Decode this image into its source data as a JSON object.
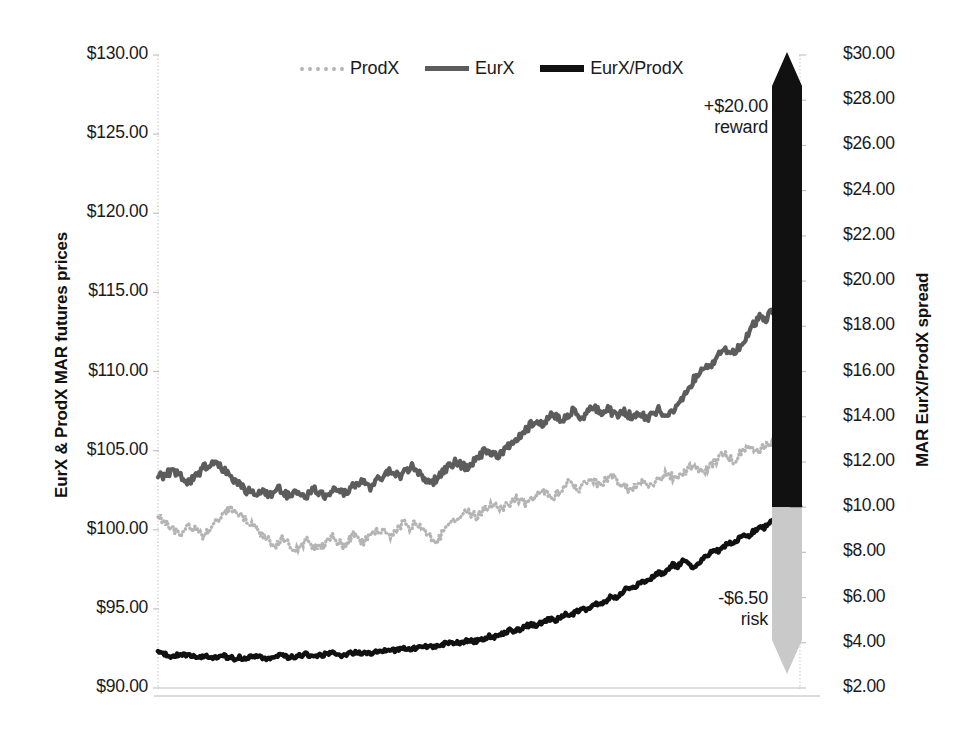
{
  "chart_data": {
    "type": "line",
    "title": "",
    "xlabel": "",
    "grid": false,
    "legend_position": "top-center",
    "axes": {
      "left": {
        "label": "EurX & ProdX MAR futures prices",
        "ticks": [
          "$90.00",
          "$95.00",
          "$100.00",
          "$105.00",
          "$110.00",
          "$115.00",
          "$120.00",
          "$125.00",
          "$130.00"
        ],
        "tick_values": [
          90,
          95,
          100,
          105,
          110,
          115,
          120,
          125,
          130
        ],
        "ylim": [
          90,
          130
        ]
      },
      "right": {
        "label": "MAR EurX/ProdX spread",
        "ticks": [
          "$2.00",
          "$4.00",
          "$6.00",
          "$8.00",
          "$10.00",
          "$12.00",
          "$14.00",
          "$16.00",
          "$18.00",
          "$20.00",
          "$22.00",
          "$24.00",
          "$26.00",
          "$28.00",
          "$30.00"
        ],
        "tick_values": [
          2,
          4,
          6,
          8,
          10,
          12,
          14,
          16,
          18,
          20,
          22,
          24,
          26,
          28,
          30
        ],
        "ylim": [
          2,
          30
        ]
      }
    },
    "legend": [
      {
        "name": "ProdX",
        "style": "dotted",
        "color": "#b4b4b4",
        "axis": "left"
      },
      {
        "name": "EurX",
        "style": "solid",
        "color": "#5c5c5c",
        "axis": "left"
      },
      {
        "name": "EurX/ProdX",
        "style": "solid",
        "color": "#111111",
        "axis": "right"
      }
    ],
    "series": [
      {
        "name": "ProdX",
        "axis": "left",
        "values": [
          100.8,
          100.6,
          100.3,
          100.0,
          99.7,
          99.9,
          100.2,
          100.1,
          99.8,
          99.6,
          99.9,
          100.3,
          100.7,
          101.1,
          101.4,
          101.2,
          101.0,
          100.7,
          100.4,
          100.1,
          99.8,
          99.5,
          99.3,
          99.1,
          99.4,
          99.2,
          99.0,
          98.8,
          99.1,
          99.3,
          99.0,
          98.8,
          99.0,
          99.3,
          99.5,
          99.2,
          99.0,
          99.3,
          99.6,
          99.4,
          99.2,
          99.5,
          99.8,
          100.0,
          99.8,
          99.6,
          99.9,
          100.2,
          100.4,
          100.2,
          100.5,
          100.3,
          100.0,
          99.6,
          99.3,
          99.6,
          100.0,
          100.3,
          100.6,
          100.9,
          101.2,
          101.0,
          100.8,
          101.1,
          101.4,
          101.6,
          101.4,
          101.2,
          101.5,
          101.8,
          102.0,
          101.8,
          101.6,
          101.9,
          102.2,
          102.5,
          102.3,
          102.1,
          102.4,
          102.7,
          103.0,
          102.8,
          102.6,
          102.9,
          103.2,
          103.0,
          102.8,
          103.1,
          103.4,
          103.2,
          103.0,
          102.7,
          102.5,
          102.8,
          103.1,
          102.9,
          102.7,
          103.0,
          103.3,
          103.6,
          103.4,
          103.2,
          103.5,
          103.8,
          104.1,
          103.9,
          103.6,
          103.9,
          104.2,
          104.5,
          104.8,
          104.6,
          104.4,
          104.7,
          105.0,
          105.3,
          105.1,
          104.9,
          105.2,
          105.5,
          105.3,
          105.1,
          105.4,
          105.7,
          105.9,
          105.8
        ]
      },
      {
        "name": "EurX",
        "axis": "left",
        "values": [
          103.5,
          103.4,
          103.6,
          103.7,
          103.5,
          103.2,
          103.0,
          103.3,
          103.6,
          103.9,
          104.1,
          104.3,
          104.1,
          103.8,
          103.5,
          103.2,
          102.9,
          102.6,
          102.4,
          102.3,
          102.5,
          102.3,
          102.1,
          102.4,
          102.6,
          102.3,
          102.1,
          102.4,
          102.2,
          102.0,
          102.3,
          102.5,
          102.3,
          102.1,
          102.4,
          102.7,
          102.5,
          102.3,
          102.6,
          102.9,
          103.1,
          102.9,
          102.7,
          103.0,
          103.3,
          103.6,
          103.8,
          103.6,
          103.4,
          103.7,
          104.0,
          103.8,
          103.5,
          103.2,
          102.9,
          103.2,
          103.5,
          103.8,
          104.1,
          104.3,
          104.1,
          103.9,
          104.2,
          104.5,
          104.8,
          105.0,
          104.8,
          104.6,
          104.9,
          105.2,
          105.5,
          105.8,
          106.1,
          106.4,
          106.7,
          106.9,
          106.7,
          107.0,
          107.3,
          107.1,
          106.9,
          107.2,
          107.5,
          107.3,
          107.1,
          107.4,
          107.7,
          107.5,
          107.3,
          107.6,
          107.4,
          107.2,
          107.5,
          107.3,
          107.1,
          107.4,
          107.2,
          107.0,
          107.3,
          107.6,
          107.4,
          107.2,
          107.5,
          108.0,
          108.5,
          109.0,
          109.5,
          110.0,
          110.4,
          110.2,
          110.6,
          111.1,
          111.5,
          111.3,
          111.1,
          111.6,
          112.1,
          112.6,
          113.0,
          113.4,
          113.2,
          113.6,
          114.1,
          114.5,
          114.9,
          115.3,
          115.6,
          115.4
        ]
      },
      {
        "name": "EurX/ProdX",
        "axis": "right",
        "values": [
          3.55,
          3.5,
          3.45,
          3.4,
          3.45,
          3.5,
          3.45,
          3.4,
          3.35,
          3.4,
          3.35,
          3.3,
          3.35,
          3.4,
          3.35,
          3.3,
          3.35,
          3.3,
          3.35,
          3.4,
          3.35,
          3.3,
          3.35,
          3.4,
          3.45,
          3.4,
          3.35,
          3.4,
          3.45,
          3.5,
          3.45,
          3.4,
          3.45,
          3.5,
          3.55,
          3.5,
          3.45,
          3.5,
          3.55,
          3.6,
          3.55,
          3.5,
          3.55,
          3.6,
          3.65,
          3.6,
          3.65,
          3.7,
          3.75,
          3.7,
          3.75,
          3.8,
          3.85,
          3.8,
          3.85,
          3.9,
          3.95,
          4.0,
          3.95,
          4.0,
          4.05,
          4.1,
          4.05,
          4.1,
          4.2,
          4.3,
          4.25,
          4.35,
          4.45,
          4.55,
          4.5,
          4.6,
          4.7,
          4.8,
          4.75,
          4.85,
          4.95,
          5.05,
          5.0,
          5.1,
          5.25,
          5.2,
          5.35,
          5.5,
          5.45,
          5.6,
          5.75,
          5.7,
          5.85,
          6.05,
          6.0,
          6.2,
          6.4,
          6.35,
          6.55,
          6.75,
          6.7,
          6.9,
          7.1,
          7.05,
          7.25,
          7.45,
          7.4,
          7.6,
          7.55,
          7.35,
          7.5,
          7.7,
          7.9,
          8.1,
          8.05,
          8.25,
          8.45,
          8.4,
          8.6,
          8.8,
          8.75,
          8.95,
          9.15,
          9.1,
          9.3,
          9.5,
          9.45,
          9.65,
          9.85,
          10.0,
          10.05
        ]
      }
    ],
    "annotations": [
      {
        "id": "reward",
        "text": "+$20.00\nreward",
        "arrow": "up",
        "color": "#111111",
        "from_value": 10.0,
        "to_value": 30.0
      },
      {
        "id": "risk",
        "text": "-$6.50\nrisk",
        "arrow": "down",
        "color": "#c9c9c9",
        "from_value": 10.0,
        "to_value": 3.5
      }
    ]
  },
  "colors": {
    "prodx": "#b4b4b4",
    "eurx": "#5c5c5c",
    "spread": "#111111",
    "reward_arrow": "#111111",
    "risk_arrow": "#c9c9c9",
    "axis_line": "#d0d0d0"
  }
}
